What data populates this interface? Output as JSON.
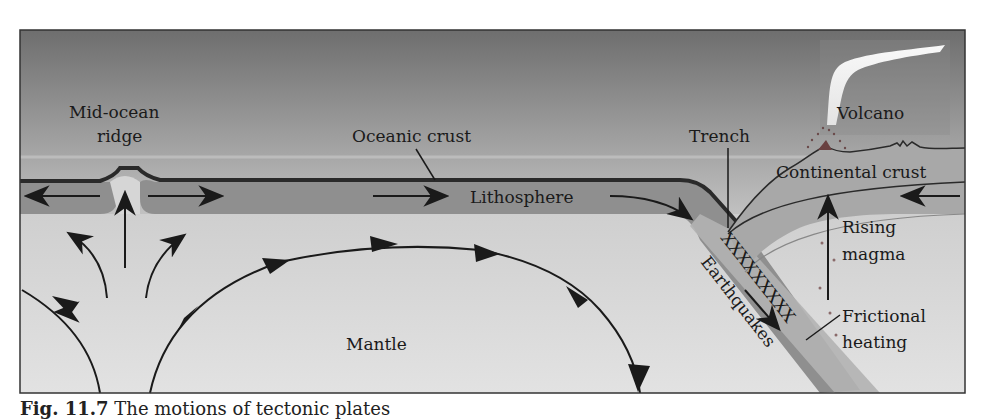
{
  "figure": {
    "type": "cross-section diagram",
    "labels": {
      "mid_ocean_ridge_line1": "Mid-ocean",
      "mid_ocean_ridge_line2": "ridge",
      "oceanic_crust": "Oceanic crust",
      "lithosphere": "Lithosphere",
      "trench": "Trench",
      "volcano": "Volcano",
      "continental_crust": "Continental crust",
      "rising_magma_line1": "Rising",
      "rising_magma_line2": "magma",
      "earthquakes": "Earthquakes",
      "earthquake_markers": "XXXXXXXXX",
      "frictional_heating_line1": "Frictional",
      "frictional_heating_line2": "heating",
      "mantle": "Mantle"
    },
    "colors": {
      "sky_top": "#6e6e6e",
      "sky_bottom": "#d6d6d6",
      "lithosphere": "#8f8f8f",
      "mantle": "#d2d2d2",
      "ink": "#1a1a1a",
      "plume": "#f2f2f2",
      "magma_dot": "#8a5a5a"
    }
  },
  "caption": {
    "fig_number": "Fig. 11.7",
    "text": "The motions of tectonic plates"
  }
}
